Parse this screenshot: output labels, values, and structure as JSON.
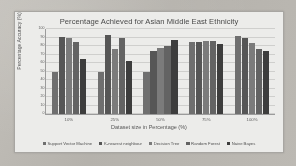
{
  "chart_data": {
    "type": "bar",
    "title": "Percentage Achieved for Asian Middle East Ethnicity",
    "xlabel": "Dataset size in Percentage (%)",
    "ylabel": "Percentage Accuracy (%)",
    "categories": [
      "10%",
      "25%",
      "50%",
      "75%",
      "100%"
    ],
    "ylim": [
      0,
      100
    ],
    "yticks": [
      0,
      10,
      20,
      30,
      40,
      50,
      60,
      70,
      80,
      90,
      100
    ],
    "grid": true,
    "legend_position": "bottom",
    "series": [
      {
        "name": "Support Vector Machine",
        "color": "#6f6f6f",
        "values": [
          50,
          50,
          50,
          85,
          92
        ]
      },
      {
        "name": "K-nearest neighbour",
        "color": "#565656",
        "values": [
          91,
          93,
          74,
          85,
          90
        ]
      },
      {
        "name": "Decision Tree",
        "color": "#7b7b7b",
        "values": [
          90,
          76,
          78,
          86,
          83
        ]
      },
      {
        "name": "Random Forest",
        "color": "#636363",
        "values": [
          85,
          89,
          80,
          86,
          76
        ]
      },
      {
        "name": "Naive Bayes",
        "color": "#3d3d3d",
        "values": [
          65,
          62,
          87,
          82,
          74
        ]
      }
    ]
  }
}
